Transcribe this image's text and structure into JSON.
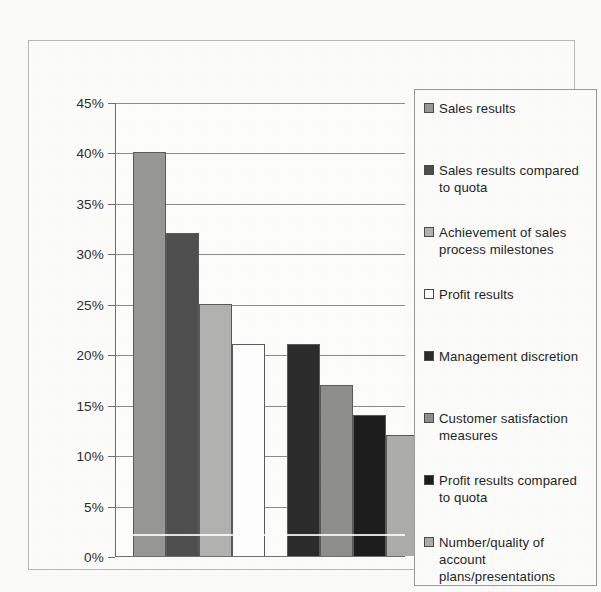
{
  "chart_data": {
    "type": "bar",
    "title": "",
    "subtitle": "",
    "xlabel": "",
    "ylabel": "",
    "ylim": [
      0,
      45
    ],
    "ytick_labels": [
      "45%",
      "40%",
      "35%",
      "30%",
      "25%",
      "20%",
      "15%",
      "10%",
      "5%",
      "0%"
    ],
    "ytick_values": [
      45,
      40,
      35,
      30,
      25,
      20,
      15,
      10,
      5,
      0
    ],
    "grid": true,
    "legend_position": "right",
    "categories": [
      "Sales results",
      "Sales results compared to quota",
      "Achievement of sales process milestones",
      "Profit results",
      "Management discretion",
      "Customer satisfaction measures",
      "Profit results compared to quota",
      "Number/quality of account plans/presentations"
    ],
    "values": [
      40,
      32,
      25,
      21,
      21,
      17,
      14,
      12
    ],
    "value_labels": [
      "40%",
      "32%",
      "25%",
      "21%",
      "21%",
      "17%",
      "14%",
      "12%"
    ],
    "colors": [
      "#989896",
      "#4f4f4f",
      "#b3b3b1",
      "#ffffff",
      "#2b2b2b",
      "#8f8f8d",
      "#1d1d1d",
      "#adadab"
    ]
  },
  "legend": {
    "items": [
      {
        "label": "Sales results",
        "color": "#989896"
      },
      {
        "label": "Sales results compared to quota",
        "color": "#4f4f4f"
      },
      {
        "label": "Achievement of sales process milestones",
        "color": "#b3b3b1"
      },
      {
        "label": "Profit results",
        "color": "#ffffff"
      },
      {
        "label": "Management discretion",
        "color": "#2b2b2b"
      },
      {
        "label": "Customer satisfaction measures",
        "color": "#8f8f8d"
      },
      {
        "label": "Profit results compared to quota",
        "color": "#1d1d1d"
      },
      {
        "label": "Number/quality of account plans/presentations",
        "color": "#adadab"
      }
    ]
  }
}
